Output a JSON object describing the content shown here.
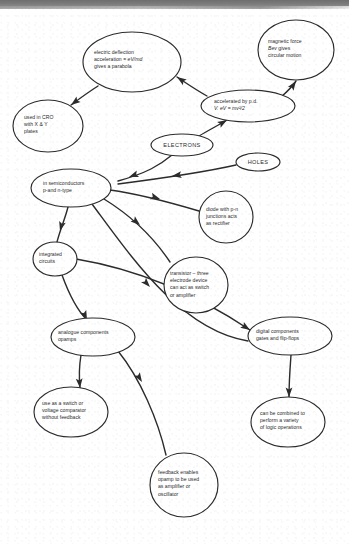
{
  "document": {
    "title": "Electrons and semiconductors concept map",
    "background_color": "#ffffff",
    "ink_color": "#2b2b2b",
    "scan_band_color": "#7c7c7c"
  },
  "chart_data": {
    "type": "diagram",
    "subtype": "concept-map",
    "node_shape": "ellipse",
    "edge_style": "curved-arrow",
    "nodes": [
      {
        "id": "electric-deflection",
        "lines": [
          "electric deflection",
          "acceleration = eV/md",
          "gives a parabola"
        ],
        "cx": 132,
        "cy": 62,
        "rx": 49,
        "ry": 30,
        "text_align": "left",
        "text_x": 94,
        "text_first_line_y": 54
      },
      {
        "id": "magnetic-force",
        "lines": [
          "magnetic force",
          "Bev gives",
          "circular motion"
        ],
        "cx": 296,
        "cy": 50,
        "rx": 38,
        "ry": 30,
        "text_align": "left",
        "text_x": 268,
        "text_first_line_y": 43
      },
      {
        "id": "accelerated-by-pd",
        "lines": [
          "accelerated by p.d.",
          "V.     eV = mv²/2"
        ],
        "cx": 248,
        "cy": 106,
        "rx": 47,
        "ry": 16,
        "text_align": "left",
        "text_x": 214,
        "text_first_line_y": 103
      },
      {
        "id": "used-in-cro",
        "lines": [
          "used in CRO",
          "with X & Y",
          "plates"
        ],
        "cx": 48,
        "cy": 126,
        "rx": 35,
        "ry": 26,
        "text_align": "left",
        "text_x": 24,
        "text_first_line_y": 119
      },
      {
        "id": "electrons",
        "lines": [
          "ELECTRONS"
        ],
        "cx": 182,
        "cy": 145,
        "rx": 31,
        "ry": 11,
        "text_align": "center",
        "text_x": 182,
        "text_first_line_y": 147
      },
      {
        "id": "holes",
        "lines": [
          "HOLES"
        ],
        "cx": 258,
        "cy": 162,
        "rx": 22,
        "ry": 9,
        "text_align": "center",
        "text_x": 258,
        "text_first_line_y": 164
      },
      {
        "id": "in-semiconductors",
        "lines": [
          "in semiconductors",
          "p-and n-type"
        ],
        "cx": 71,
        "cy": 188,
        "rx": 40,
        "ry": 19,
        "text_align": "left",
        "text_x": 43,
        "text_first_line_y": 185
      },
      {
        "id": "diode",
        "lines": [
          "diode with p-n",
          "junctions acts",
          "as rectifier"
        ],
        "cx": 226,
        "cy": 217,
        "rx": 27,
        "ry": 26,
        "text_align": "left",
        "text_x": 206,
        "text_first_line_y": 211
      },
      {
        "id": "integrated-circuits",
        "lines": [
          "integrated",
          "circuits"
        ],
        "cx": 55,
        "cy": 259,
        "rx": 22,
        "ry": 17,
        "text_align": "left",
        "text_x": 39,
        "text_first_line_y": 256
      },
      {
        "id": "transistor",
        "lines": [
          "transistor – three",
          "electrode device",
          "can act as switch",
          "or amplifier"
        ],
        "cx": 196,
        "cy": 285,
        "rx": 32,
        "ry": 28,
        "text_align": "left",
        "text_x": 170,
        "text_first_line_y": 275
      },
      {
        "id": "analogue-components",
        "lines": [
          "analogue components",
          "opamps"
        ],
        "cx": 93,
        "cy": 337,
        "rx": 42,
        "ry": 19,
        "text_align": "left",
        "text_x": 58,
        "text_first_line_y": 334
      },
      {
        "id": "digital-components",
        "lines": [
          "digital components",
          "gates and flip-flops"
        ],
        "cx": 290,
        "cy": 336,
        "rx": 42,
        "ry": 19,
        "text_align": "left",
        "text_x": 256,
        "text_first_line_y": 333
      },
      {
        "id": "use-as-switch",
        "lines": [
          "use as a switch or",
          "voltage comparator",
          "without feedback"
        ],
        "cx": 71,
        "cy": 412,
        "rx": 37,
        "ry": 25,
        "text_align": "left",
        "text_x": 42,
        "text_first_line_y": 405
      },
      {
        "id": "logic-operations",
        "lines": [
          "can be combined to",
          "perform a variety",
          "of logic operations"
        ],
        "cx": 288,
        "cy": 422,
        "rx": 37,
        "ry": 25,
        "text_align": "left",
        "text_x": 260,
        "text_first_line_y": 415
      },
      {
        "id": "feedback-opamp",
        "lines": [
          "feedback enables",
          "opamp to be used",
          "as amplifier or",
          "oscillator"
        ],
        "cx": 184,
        "cy": 485,
        "rx": 34,
        "ry": 32,
        "text_align": "left",
        "text_x": 158,
        "text_first_line_y": 474
      }
    ],
    "edges": [
      {
        "id": "accelerated-to-electric-deflection",
        "from": "accelerated-by-pd",
        "to": "electric-deflection",
        "path": "M 207 96 C 196 90 186 83 177 77",
        "arrow_at": [
          177,
          77
        ],
        "arrow_angle": -146
      },
      {
        "id": "accelerated-to-magnetic-force",
        "from": "accelerated-by-pd",
        "to": "magnetic-force",
        "path": "M 281 97 C 288 91 292 87 296 81",
        "arrow_at": [
          296,
          81
        ],
        "arrow_angle": -56
      },
      {
        "id": "electric-deflection-to-cro",
        "from": "electric-deflection",
        "to": "used-in-cro",
        "path": "M 98 86 C 87 93 79 99 71 105",
        "arrow_at": [
          71,
          105
        ],
        "arrow_angle": 143
      },
      {
        "id": "electrons-to-accelerated",
        "from": "electrons",
        "to": "accelerated-by-pd",
        "path": "M 199 136 C 209 130 217 126 227 120",
        "arrow_at": [
          227,
          120
        ],
        "arrow_angle": -31
      },
      {
        "id": "electrons-to-semiconductors",
        "from": "electrons",
        "to": "in-semiconductors",
        "path": "M 172 155 C 160 165 147 173 118 181",
        "arrow_at": [
          129,
          177
        ],
        "arrow_angle": 160
      },
      {
        "id": "holes-to-semiconductors",
        "from": "holes",
        "to": "in-semiconductors",
        "path": "M 236 165 C 205 172 180 176 118 184",
        "arrow_at": [
          172,
          176
        ],
        "arrow_angle": 172
      },
      {
        "id": "semiconductors-to-diode",
        "from": "in-semiconductors",
        "to": "diode",
        "path": "M 110 190 C 140 194 172 203 199 211",
        "arrow_at": [
          160,
          199
        ],
        "arrow_angle": 18
      },
      {
        "id": "semiconductors-to-transistor",
        "from": "in-semiconductors",
        "to": "transistor",
        "path": "M 104 199 C 130 215 152 235 170 262",
        "arrow_at": [
          140,
          225
        ],
        "arrow_angle": 40
      },
      {
        "id": "semiconductors-to-integrated",
        "from": "in-semiconductors",
        "to": "integrated-circuits",
        "path": "M 68 207 C 65 219 60 230 57 242",
        "arrow_at": [
          60,
          231
        ],
        "arrow_angle": 105
      },
      {
        "id": "semiconductors-to-digital",
        "from": "in-semiconductors",
        "to": "digital-components",
        "path": "M 92 204 C 130 255 180 330 248 341",
        "arrow_at": [
          150,
          287
        ],
        "arrow_angle": 47
      },
      {
        "id": "integrated-to-analogue",
        "from": "integrated-circuits",
        "to": "analogue-components",
        "path": "M 62 275 C 70 297 80 313 87 320",
        "arrow_at": [
          87,
          320
        ],
        "arrow_angle": 66
      },
      {
        "id": "integrated-to-digital",
        "from": "integrated-circuits",
        "to": "digital-components",
        "path": "M 76 259 C 130 268 190 290 250 330",
        "arrow_at": [
          250,
          330
        ],
        "arrow_angle": 33
      },
      {
        "id": "analogue-to-switch",
        "from": "analogue-components",
        "to": "use-as-switch",
        "path": "M 81 355 C 79 367 79 378 80 388",
        "arrow_at": [
          80,
          388
        ],
        "arrow_angle": 85
      },
      {
        "id": "analogue-to-feedback",
        "from": "analogue-components",
        "to": "feedback-opamp",
        "path": "M 118 351 C 140 378 158 420 166 455",
        "arrow_at": [
          142,
          382
        ],
        "arrow_angle": 58
      },
      {
        "id": "digital-to-logic",
        "from": "digital-components",
        "to": "logic-operations",
        "path": "M 291 355 C 290 369 289 382 289 397",
        "arrow_at": [
          289,
          397
        ],
        "arrow_angle": 90
      }
    ]
  }
}
